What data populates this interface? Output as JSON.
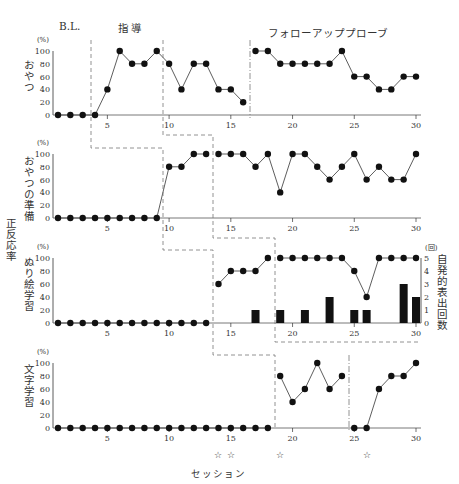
{
  "chart_data": {
    "type": "line",
    "title": "",
    "xlabel": "セッション",
    "ylabel": "正反応率",
    "sessions": [
      1,
      2,
      3,
      4,
      5,
      6,
      7,
      8,
      9,
      10,
      11,
      12,
      13,
      14,
      15,
      16,
      17,
      18,
      19,
      20,
      21,
      22,
      23,
      24,
      25,
      26,
      27,
      28,
      29,
      30
    ],
    "x_ticks": [
      5,
      10,
      15,
      20,
      25,
      30
    ],
    "phase_labels": [
      "B.L.",
      "指 導",
      "フォローアッププローブ"
    ],
    "y_unit": "(%)",
    "y_ticks": [
      0,
      20,
      40,
      60,
      80,
      100
    ],
    "ylim": [
      0,
      100
    ],
    "grid": false,
    "panels": [
      {
        "name": "おやつ",
        "values": [
          0,
          0,
          0,
          0,
          40,
          100,
          80,
          80,
          100,
          80,
          40,
          80,
          80,
          40,
          40,
          20,
          100,
          100,
          80,
          80,
          80,
          80,
          80,
          100,
          60,
          60,
          40,
          40,
          60,
          60
        ],
        "breaks_after": [
          16
        ]
      },
      {
        "name": "おやつの準備",
        "values": [
          0,
          0,
          0,
          0,
          0,
          0,
          0,
          0,
          0,
          80,
          80,
          100,
          100,
          100,
          100,
          100,
          80,
          100,
          40,
          100,
          100,
          80,
          60,
          80,
          100,
          60,
          80,
          60,
          60,
          100
        ],
        "breaks_after": [
          13
        ]
      },
      {
        "name": "ぬり絵学習",
        "values": [
          0,
          0,
          0,
          0,
          0,
          0,
          0,
          0,
          0,
          0,
          0,
          0,
          0,
          60,
          80,
          80,
          80,
          100,
          100,
          100,
          100,
          100,
          100,
          100,
          80,
          40,
          100,
          100,
          100,
          100
        ],
        "breaks_after": [
          13,
          18
        ],
        "secondary_axis": {
          "label": "自発的表出回数",
          "unit": "(回)",
          "ticks": [
            0,
            1,
            2,
            3,
            4,
            5
          ],
          "ylim": [
            0,
            5
          ],
          "type": "bar",
          "bars": [
            {
              "session": 17,
              "value": 1
            },
            {
              "session": 19,
              "value": 1
            },
            {
              "session": 21,
              "value": 1
            },
            {
              "session": 23,
              "value": 2
            },
            {
              "session": 25,
              "value": 1
            },
            {
              "session": 26,
              "value": 1
            },
            {
              "session": 29,
              "value": 3
            },
            {
              "session": 30,
              "value": 2
            }
          ]
        }
      },
      {
        "name": "文字学習",
        "values": [
          0,
          0,
          0,
          0,
          0,
          0,
          0,
          0,
          0,
          0,
          0,
          0,
          0,
          0,
          0,
          0,
          0,
          0,
          80,
          40,
          60,
          100,
          60,
          80,
          0,
          0,
          60,
          80,
          80,
          100
        ],
        "breaks_after": [
          18,
          24
        ]
      }
    ],
    "star_markers": {
      "symbol": "☆",
      "sessions": [
        14,
        15,
        19,
        26
      ]
    }
  }
}
